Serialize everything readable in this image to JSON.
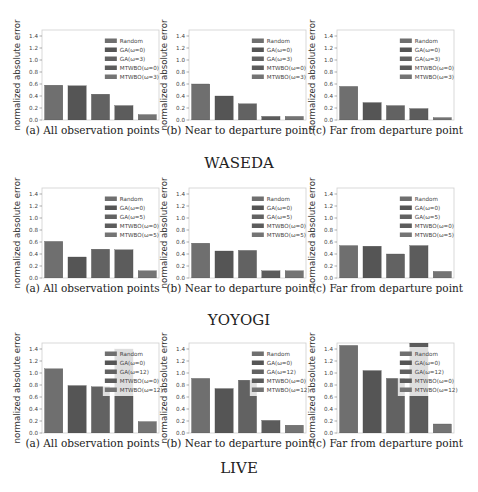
{
  "figure": {
    "groups": [
      {
        "title": "WASEDA"
      },
      {
        "title": "YOYOGI"
      },
      {
        "title": "LIVE"
      }
    ]
  },
  "chart_data": [
    {
      "type": "bar",
      "group": "WASEDA",
      "panel": "a",
      "title": "(a) All observation points",
      "xlabel": "",
      "ylabel": "normalized absolute error",
      "ylim": [
        0,
        1.5
      ],
      "yticks": [
        "0.0",
        "0.2",
        "0.4",
        "0.6",
        "0.8",
        "1.0",
        "1.2",
        "1.4"
      ],
      "categories": [
        "Random",
        "GA(ω=0)",
        "GA(ω=3)",
        "MTWBO(ω=0)",
        "MTWBO(ω=3)"
      ],
      "values": [
        0.58,
        0.57,
        0.43,
        0.24,
        0.09
      ],
      "legend": [
        "Random",
        "GA(ω=0)",
        "GA(ω=3)",
        "MTWBO(ω=0)",
        "MTWBO(ω=3)"
      ],
      "legend_position": "top-right",
      "grid": false
    },
    {
      "type": "bar",
      "group": "WASEDA",
      "panel": "b",
      "title": "(b) Near to departure point",
      "xlabel": "",
      "ylabel": "normalized absolute error",
      "ylim": [
        0,
        1.5
      ],
      "yticks": [
        "0.0",
        "0.2",
        "0.4",
        "0.6",
        "0.8",
        "1.0",
        "1.2",
        "1.4"
      ],
      "categories": [
        "Random",
        "GA(ω=0)",
        "GA(ω=3)",
        "MTWBO(ω=0)",
        "MTWBO(ω=3)"
      ],
      "values": [
        0.6,
        0.4,
        0.27,
        0.06,
        0.06
      ],
      "legend": [
        "Random",
        "GA(ω=0)",
        "GA(ω=3)",
        "MTWBO(ω=0)",
        "MTWBO(ω=3)"
      ],
      "legend_position": "top-right",
      "grid": false
    },
    {
      "type": "bar",
      "group": "WASEDA",
      "panel": "c",
      "title": "(c) Far from departure point",
      "xlabel": "",
      "ylabel": "normalized absolute error",
      "ylim": [
        0,
        1.5
      ],
      "yticks": [
        "0.0",
        "0.2",
        "0.4",
        "0.6",
        "0.8",
        "1.0",
        "1.2",
        "1.4"
      ],
      "categories": [
        "Random",
        "GA(ω=0)",
        "GA(ω=3)",
        "MTWBO(ω=0)",
        "MTWBO(ω=3)"
      ],
      "values": [
        0.56,
        0.29,
        0.24,
        0.19,
        0.04
      ],
      "legend": [
        "Random",
        "GA(ω=0)",
        "GA(ω=3)",
        "MTWBO(ω=0)",
        "MTWBO(ω=3)"
      ],
      "legend_position": "top-right",
      "grid": false
    },
    {
      "type": "bar",
      "group": "YOYOGI",
      "panel": "a",
      "title": "(a) All observation points",
      "xlabel": "",
      "ylabel": "normalized absolute error",
      "ylim": [
        0,
        1.5
      ],
      "yticks": [
        "0.0",
        "0.2",
        "0.4",
        "0.6",
        "0.8",
        "1.0",
        "1.2",
        "1.4"
      ],
      "categories": [
        "Random",
        "GA(ω=0)",
        "GA(ω=5)",
        "MTWBO(ω=0)",
        "MTWBO(ω=5)"
      ],
      "values": [
        0.61,
        0.35,
        0.48,
        0.47,
        0.12
      ],
      "legend": [
        "Random",
        "GA(ω=0)",
        "GA(ω=5)",
        "MTWBO(ω=0)",
        "MTWBO(ω=5)"
      ],
      "legend_position": "top-right",
      "grid": false
    },
    {
      "type": "bar",
      "group": "YOYOGI",
      "panel": "b",
      "title": "(b) Near to departure point",
      "xlabel": "",
      "ylabel": "normalized absolute error",
      "ylim": [
        0,
        1.5
      ],
      "yticks": [
        "0.0",
        "0.2",
        "0.4",
        "0.6",
        "0.8",
        "1.0",
        "1.2",
        "1.4"
      ],
      "categories": [
        "Random",
        "GA(ω=0)",
        "GA(ω=5)",
        "MTWBO(ω=0)",
        "MTWBO(ω=5)"
      ],
      "values": [
        0.58,
        0.45,
        0.46,
        0.12,
        0.12
      ],
      "legend": [
        "Random",
        "GA(ω=0)",
        "GA(ω=5)",
        "MTWBO(ω=0)",
        "MTWBO(ω=5)"
      ],
      "legend_position": "top-right",
      "grid": false
    },
    {
      "type": "bar",
      "group": "YOYOGI",
      "panel": "c",
      "title": "(c) Far from departure point",
      "xlabel": "",
      "ylabel": "normalized absolute error",
      "ylim": [
        0,
        1.5
      ],
      "yticks": [
        "0.0",
        "0.2",
        "0.4",
        "0.6",
        "0.8",
        "1.0",
        "1.2",
        "1.4"
      ],
      "categories": [
        "Random",
        "GA(ω=0)",
        "GA(ω=5)",
        "MTWBO(ω=0)",
        "MTWBO(ω=5)"
      ],
      "values": [
        0.54,
        0.53,
        0.4,
        0.54,
        0.11
      ],
      "legend": [
        "Random",
        "GA(ω=0)",
        "GA(ω=5)",
        "MTWBO(ω=0)",
        "MTWBO(ω=5)"
      ],
      "legend_position": "top-right",
      "grid": false
    },
    {
      "type": "bar",
      "group": "LIVE",
      "panel": "a",
      "title": "(a) All observation points",
      "xlabel": "",
      "ylabel": "normalized absolute error",
      "ylim": [
        0,
        1.5
      ],
      "yticks": [
        "0.0",
        "0.2",
        "0.4",
        "0.6",
        "0.8",
        "1.0",
        "1.2",
        "1.4"
      ],
      "categories": [
        "Random",
        "GA(ω=0)",
        "GA(ω=12)",
        "MTWBO(ω=0)",
        "MTWBO(ω=12)"
      ],
      "values": [
        1.07,
        0.79,
        0.77,
        1.4,
        0.19
      ],
      "legend": [
        "Random",
        "GA(ω=0)",
        "GA(ω=12)",
        "MTWBO(ω=0)",
        "MTWBO(ω=12)"
      ],
      "legend_position": "top-right",
      "grid": false
    },
    {
      "type": "bar",
      "group": "LIVE",
      "panel": "b",
      "title": "(b) Near to departure point",
      "xlabel": "",
      "ylabel": "normalized absolute error",
      "ylim": [
        0,
        1.5
      ],
      "yticks": [
        "0.0",
        "0.2",
        "0.4",
        "0.6",
        "0.8",
        "1.0",
        "1.2",
        "1.4"
      ],
      "categories": [
        "Random",
        "GA(ω=0)",
        "GA(ω=12)",
        "MTWBO(ω=0)",
        "MTWBO(ω=12)"
      ],
      "values": [
        0.91,
        0.74,
        0.88,
        0.21,
        0.13
      ],
      "legend": [
        "Random",
        "GA(ω=0)",
        "GA(ω=12)",
        "MTWBO(ω=0)",
        "MTWBO(ω=12)"
      ],
      "legend_position": "top-right",
      "grid": false
    },
    {
      "type": "bar",
      "group": "LIVE",
      "panel": "c",
      "title": "(c) Far from departure point",
      "xlabel": "",
      "ylabel": "normalized absolute error",
      "ylim": [
        0,
        1.5
      ],
      "yticks": [
        "0.0",
        "0.2",
        "0.4",
        "0.6",
        "0.8",
        "1.0",
        "1.2",
        "1.4"
      ],
      "categories": [
        "Random",
        "GA(ω=0)",
        "GA(ω=12)",
        "MTWBO(ω=0)",
        "MTWBO(ω=12)"
      ],
      "values": [
        1.46,
        1.04,
        0.91,
        1.5,
        0.15
      ],
      "legend": [
        "Random",
        "GA(ω=0)",
        "GA(ω=12)",
        "MTWBO(ω=0)",
        "MTWBO(ω=12)"
      ],
      "legend_position": "top-right",
      "grid": false
    }
  ],
  "colors": {
    "bars": [
      "#6f6f6f",
      "#555555",
      "#626262",
      "#5c5c5c",
      "#747474"
    ],
    "frame": "#cfcfcf",
    "text": "#222222"
  }
}
